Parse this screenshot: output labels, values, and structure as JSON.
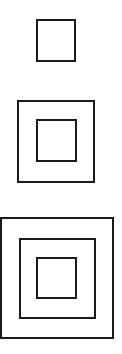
{
  "figure": {
    "stroke_color": "#1a1a1a",
    "background": "#ffffff",
    "groups": [
      {
        "name": "one-square",
        "squares": [
          {
            "x": 37,
            "y": 20,
            "w": 38,
            "h": 41
          }
        ]
      },
      {
        "name": "two-squares",
        "squares": [
          {
            "x": 18,
            "y": 101,
            "w": 76,
            "h": 81
          },
          {
            "x": 37,
            "y": 120,
            "w": 39,
            "h": 41
          }
        ]
      },
      {
        "name": "three-squares",
        "squares": [
          {
            "x": 1,
            "y": 218,
            "w": 112,
            "h": 120
          },
          {
            "x": 20,
            "y": 239,
            "w": 75,
            "h": 79
          },
          {
            "x": 37,
            "y": 258,
            "w": 39,
            "h": 40
          }
        ]
      }
    ]
  }
}
